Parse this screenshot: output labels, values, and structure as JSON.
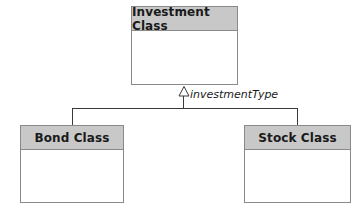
{
  "diagram": {
    "type": "uml-class-generalization",
    "parent": {
      "name": "Investment Class"
    },
    "children": [
      {
        "name": "Bond Class"
      },
      {
        "name": "Stock Class"
      }
    ],
    "discriminator_label": "investmentType",
    "colors": {
      "header_fill": "#c8c8c8",
      "border": "#8a8a8a",
      "line": "#3a3a3a",
      "background": "#ffffff"
    }
  }
}
